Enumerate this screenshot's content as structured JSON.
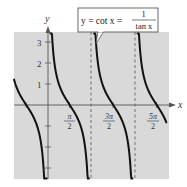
{
  "chart_data": {
    "type": "line",
    "function": "cot(x)",
    "xlabel": "x",
    "ylabel": "y",
    "xlim": [
      -1.05,
      2.75
    ],
    "xlim_unit": "pi",
    "ylim": [
      -3.4,
      3.5
    ],
    "x_ticks": [
      {
        "value_pi": 0.5,
        "label_num": "π",
        "label_den": "2"
      },
      {
        "value_pi": 1.5,
        "label_num": "3π",
        "label_den": "2"
      },
      {
        "value_pi": 2.5,
        "label_num": "5π",
        "label_den": "2"
      }
    ],
    "x_tick_marks_pi": [
      -1,
      0.5,
      1.5,
      2.5
    ],
    "y_ticks": [
      {
        "value": 1,
        "label": "1"
      },
      {
        "value": 2,
        "label": "2"
      },
      {
        "value": 3,
        "label": "3"
      }
    ],
    "y_tick_marks": [
      -3,
      -2,
      -1,
      1,
      2,
      3
    ],
    "asymptotes_pi": [
      0,
      1,
      2
    ],
    "dashed_asymptotes_pi": [
      1,
      2
    ],
    "branches": [
      {
        "from_pi": -0.78,
        "to_pi": -0.03,
        "note": "branch left of y-axis, crosses x-axis at -π/2"
      },
      {
        "from_pi": 0.06,
        "to_pi": 0.94,
        "note": "crosses x-axis at π/2"
      },
      {
        "from_pi": 1.06,
        "to_pi": 1.94,
        "note": "crosses x-axis at 3π/2"
      },
      {
        "from_pi": 2.06,
        "to_pi": 2.72,
        "note": "crosses x-axis at 5π/2"
      }
    ],
    "sample_points": [
      {
        "x": "-π/2",
        "y": 0
      },
      {
        "x": "π/4",
        "y": 1
      },
      {
        "x": "π/2",
        "y": 0
      },
      {
        "x": "3π/4",
        "y": -1
      },
      {
        "x": "3π/2",
        "y": 0
      },
      {
        "x": "5π/2",
        "y": 0
      }
    ],
    "grid": false,
    "background": "#d9d9d9",
    "curve_color": "#111111",
    "legend": null,
    "annotation": {
      "text_left": "y = cot x = ",
      "fraction_num": "1",
      "fraction_den": "tan x"
    }
  },
  "labels": {
    "x_axis": "x",
    "y_axis": "y",
    "y1": "1",
    "y2": "2",
    "y3": "3",
    "xt1_num": "π",
    "xt1_den": "2",
    "xt2_num": "3π",
    "xt2_den": "2",
    "xt3_num": "5π",
    "xt3_den": "2",
    "callout_left": "y = cot x = ",
    "callout_num": "1",
    "callout_den": "tan x"
  }
}
